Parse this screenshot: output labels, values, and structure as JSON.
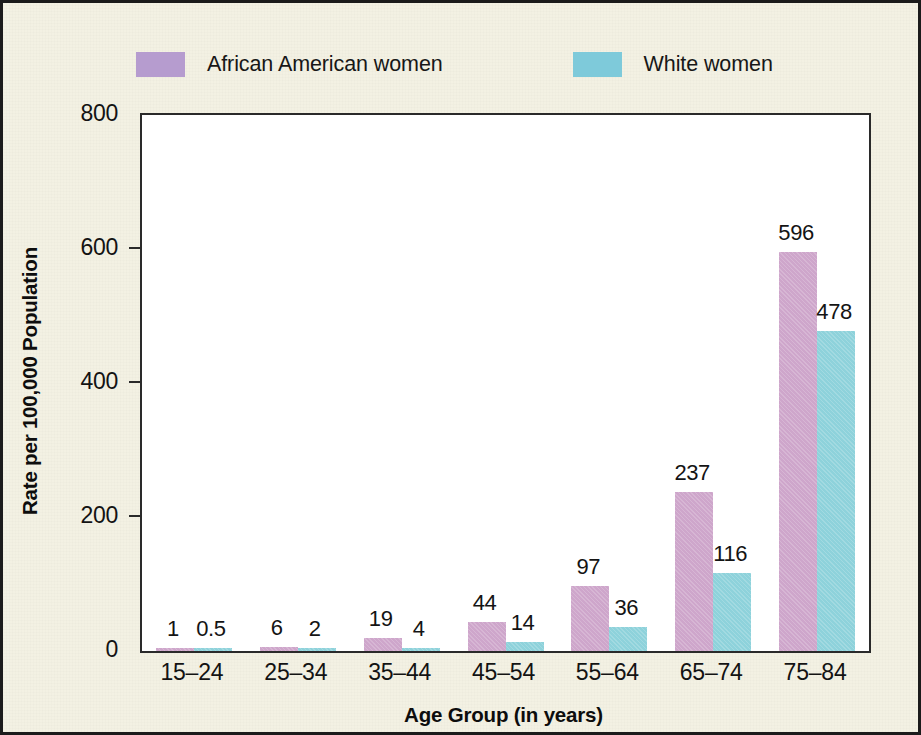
{
  "figure": {
    "background_color": "#f3f1e3",
    "border_color": "#1b1b1b",
    "plot_background_color": "#ffffff"
  },
  "legend": {
    "items": [
      {
        "label": "African American women",
        "swatch_color": "#b69ccf"
      },
      {
        "label": "White women",
        "swatch_color": "#7ecada"
      }
    ]
  },
  "chart_data": {
    "type": "bar",
    "title": "",
    "subtitle": "",
    "xlabel": "Age Group (in years)",
    "ylabel": "Rate per 100,000 Population",
    "categories": [
      "15–24",
      "25–34",
      "35–44",
      "45–54",
      "55–64",
      "65–74",
      "75–84"
    ],
    "series": [
      {
        "name": "African American women",
        "color": "#cea6cb",
        "values": [
          1,
          6,
          19,
          44,
          97,
          237,
          596
        ],
        "value_labels": [
          "1",
          "6",
          "19",
          "44",
          "97",
          "237",
          "596"
        ]
      },
      {
        "name": "White women",
        "color": "#8ed2db",
        "values": [
          0.5,
          2,
          4,
          14,
          36,
          116,
          478
        ],
        "value_labels": [
          "0.5",
          "2",
          "4",
          "14",
          "36",
          "116",
          "478"
        ]
      }
    ],
    "ylim": [
      0,
      800
    ],
    "yticks": [
      0,
      200,
      400,
      600,
      800
    ],
    "ytick_labels": [
      "0",
      "200",
      "400",
      "600",
      "800"
    ],
    "grid": false,
    "legend_position": "above-plot",
    "bar_labels_shown": true
  }
}
